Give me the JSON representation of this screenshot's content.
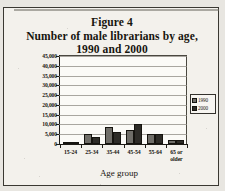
{
  "figure": {
    "title_lines": [
      "Figure 4",
      "Number of male librarians by age,",
      "1990 and 2000"
    ]
  },
  "chart_data": {
    "type": "bar",
    "xlabel": "Age group",
    "ylabel": "",
    "categories": [
      "15-24",
      "25-34",
      "35-44",
      "45-54",
      "55-64",
      "65 or older"
    ],
    "series": [
      {
        "name": "1990",
        "color": "#6f6d68",
        "values": [
          1000,
          5200,
          8900,
          7400,
          5000,
          2200
        ]
      },
      {
        "name": "2000",
        "color": "#2d2b27",
        "values": [
          1000,
          3700,
          6100,
          10000,
          5300,
          2200
        ]
      }
    ],
    "ylim": [
      0,
      45000
    ],
    "ytick_values": [
      45000,
      40000,
      35000,
      30000,
      25000,
      20000,
      15000,
      10000,
      5000,
      0
    ],
    "ytick_labels": [
      "45,000",
      "40,000",
      "35,000",
      "30,000",
      "25,000",
      "20,000",
      "15,000",
      "10,000",
      "5,000",
      "0"
    ],
    "grid": true,
    "legend_position": "right"
  }
}
